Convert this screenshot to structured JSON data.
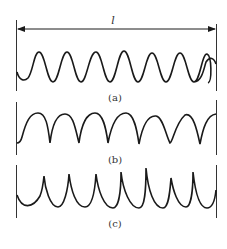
{
  "figure": {
    "dimension_label": "l",
    "panels": [
      {
        "id": "a",
        "label": "(a)",
        "description": "sinusoidal waveform, 7 periods"
      },
      {
        "id": "b",
        "label": "(b)",
        "description": "rounded crests with sharp troughs, 7 periods"
      },
      {
        "id": "c",
        "label": "(c)",
        "description": "cusped peaks with rounded troughs (cycloid-like), 7 periods"
      }
    ],
    "colors": {
      "line": "#1a1a1a",
      "background": "#ffffff"
    }
  }
}
